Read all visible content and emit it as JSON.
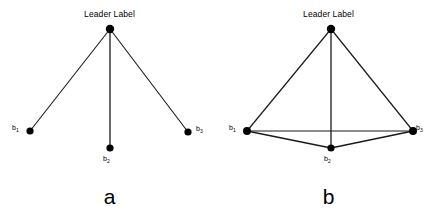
{
  "figure": {
    "background_color": "#ffffff",
    "line_color": "#1a1a1a",
    "node_color": "#000000",
    "panels": [
      {
        "id": "a",
        "caption": "a",
        "leader_label": "Leader Label",
        "topology": "star",
        "nodes": [
          {
            "id": "leader",
            "label": "Leader Label",
            "x": 110,
            "y": 29,
            "r": 4.2
          },
          {
            "id": "b1",
            "label_base": "b",
            "label_sub": "1",
            "x": 30,
            "y": 131,
            "r": 3.6
          },
          {
            "id": "b2",
            "label_base": "b",
            "label_sub": "2",
            "x": 110,
            "y": 148,
            "r": 3.6
          },
          {
            "id": "b3",
            "label_base": "b",
            "label_sub": "3",
            "x": 188,
            "y": 132,
            "r": 3.6
          }
        ],
        "edges": [
          {
            "from": "leader",
            "to": "b1"
          },
          {
            "from": "leader",
            "to": "b2"
          },
          {
            "from": "leader",
            "to": "b3"
          }
        ]
      },
      {
        "id": "b",
        "caption": "b",
        "leader_label": "Leader Label",
        "topology": "complete",
        "nodes": [
          {
            "id": "leader",
            "label": "Leader Label",
            "x": 112,
            "y": 29,
            "r": 4.2
          },
          {
            "id": "b1",
            "label_base": "b",
            "label_sub": "1",
            "x": 28,
            "y": 131,
            "r": 4.0
          },
          {
            "id": "b2",
            "label_base": "b",
            "label_sub": "2",
            "x": 112,
            "y": 148,
            "r": 3.6
          },
          {
            "id": "b3",
            "label_base": "b",
            "label_sub": "3",
            "x": 194,
            "y": 131,
            "r": 4.0
          }
        ],
        "edges": [
          {
            "from": "leader",
            "to": "b1"
          },
          {
            "from": "leader",
            "to": "b2"
          },
          {
            "from": "leader",
            "to": "b3"
          },
          {
            "from": "b1",
            "to": "b2"
          },
          {
            "from": "b2",
            "to": "b3"
          },
          {
            "from": "b1",
            "to": "b3"
          }
        ]
      }
    ]
  }
}
